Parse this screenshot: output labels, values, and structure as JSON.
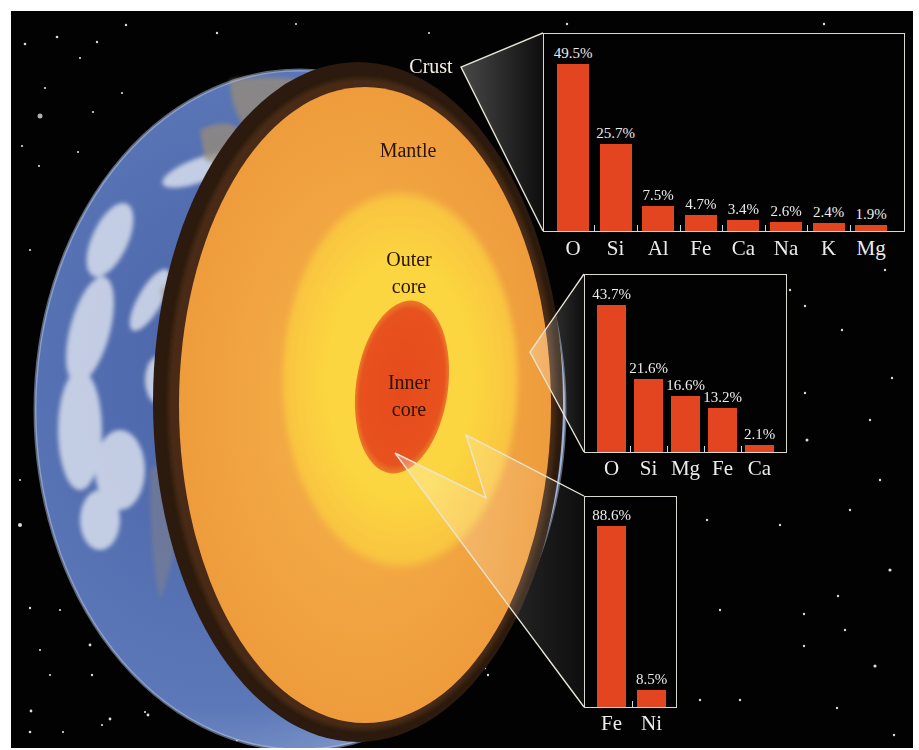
{
  "diagram": {
    "layers": {
      "crust": "Crust",
      "mantle": "Mantle",
      "outer_core_line1": "Outer",
      "outer_core_line2": "core",
      "inner_core_line1": "Inner",
      "inner_core_line2": "core"
    },
    "colors": {
      "background": "#020202",
      "mantle": "#f0a040",
      "outer_core": "#fbd23c",
      "inner_core": "#e8501e",
      "crust_rim": "#2a1a0e",
      "ocean": "#5a74b4",
      "bar": "#e2451f",
      "callout_line": "#e8e4d6"
    }
  },
  "chart_data": [
    {
      "type": "bar",
      "title": "Crust composition",
      "categories": [
        "O",
        "Si",
        "Al",
        "Fe",
        "Ca",
        "Na",
        "K",
        "Mg"
      ],
      "values": [
        49.5,
        25.7,
        7.5,
        4.7,
        3.4,
        2.6,
        2.4,
        1.9
      ],
      "labels": [
        "49.5%",
        "25.7%",
        "7.5%",
        "4.7%",
        "3.4%",
        "2.6%",
        "2.4%",
        "1.9%"
      ],
      "xlabel": "",
      "ylabel": "",
      "ylim": [
        0,
        50
      ],
      "grid": false,
      "legend": "none"
    },
    {
      "type": "bar",
      "title": "Mantle composition",
      "categories": [
        "O",
        "Si",
        "Mg",
        "Fe",
        "Ca"
      ],
      "values": [
        43.7,
        21.6,
        16.6,
        13.2,
        2.1
      ],
      "labels": [
        "43.7%",
        "21.6%",
        "16.6%",
        "13.2%",
        "2.1%"
      ],
      "xlabel": "",
      "ylabel": "",
      "ylim": [
        0,
        45
      ],
      "grid": false,
      "legend": "none"
    },
    {
      "type": "bar",
      "title": "Core composition",
      "categories": [
        "Fe",
        "Ni"
      ],
      "values": [
        88.6,
        8.5
      ],
      "labels": [
        "88.6%",
        "8.5%"
      ],
      "xlabel": "",
      "ylabel": "",
      "ylim": [
        0,
        90
      ],
      "grid": false,
      "legend": "none"
    }
  ]
}
